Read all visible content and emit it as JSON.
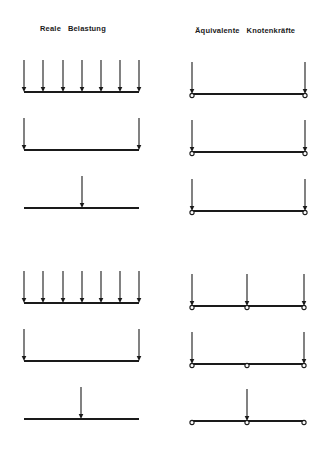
{
  "headers": {
    "left_word1": "Reale",
    "left_word2": "Belastung",
    "right_word1": "Äquivalente",
    "right_word2": "Knotenkräfte"
  },
  "colors": {
    "line": "#1a1a1a",
    "background": "#ffffff"
  },
  "diagram": {
    "left_x": [
      24,
      139
    ],
    "right_x": [
      192,
      305
    ],
    "rows": [
      {
        "label": "uniform-load-2node",
        "left_y": 92,
        "right_y": 94,
        "left_arrows": [
          24,
          43,
          63,
          82,
          101,
          120,
          139
        ],
        "right_arrows": [
          192,
          305
        ],
        "right_nodes": [
          192,
          305
        ]
      },
      {
        "label": "end-loads-2node",
        "left_y": 150,
        "right_y": 152,
        "left_arrows": [
          24,
          139
        ],
        "right_arrows": [
          192,
          305
        ],
        "right_nodes": [
          192,
          305
        ]
      },
      {
        "label": "center-load-2node",
        "left_y": 208,
        "right_y": 211,
        "left_arrows": [
          82
        ],
        "right_arrows": [
          192,
          305
        ],
        "right_nodes": [
          192,
          305
        ]
      },
      {
        "label": "uniform-load-3node",
        "left_y": 303,
        "right_y": 306,
        "left_arrows": [
          24,
          43,
          63,
          82,
          101,
          120,
          139
        ],
        "right_arrows": [
          192,
          247,
          304
        ],
        "right_nodes": [
          192,
          247,
          304
        ]
      },
      {
        "label": "end-loads-3node",
        "left_y": 361,
        "right_y": 364,
        "left_arrows": [
          24,
          139
        ],
        "right_arrows": [
          192,
          304
        ],
        "right_nodes": [
          192,
          247,
          304
        ]
      },
      {
        "label": "center-load-3node",
        "left_y": 419,
        "right_y": 421,
        "left_arrows": [
          81
        ],
        "right_arrows": [
          247
        ],
        "right_nodes": [
          192,
          247,
          304
        ]
      }
    ],
    "arrow_length": 32
  }
}
